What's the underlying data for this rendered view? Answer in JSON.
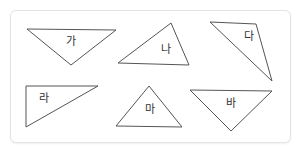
{
  "diagram": {
    "type": "triangle-classification",
    "stroke_color": "#555555",
    "border_color": "#e3e3e3",
    "triangles": [
      {
        "label": "가",
        "points": "27,29 116,30 71,65",
        "label_x": 71,
        "label_y": 42
      },
      {
        "label": "나",
        "points": "118,63 171,23 189,65",
        "label_x": 166,
        "label_y": 50
      },
      {
        "label": "다",
        "points": "210,22 256,24 272,81",
        "label_x": 249,
        "label_y": 37
      },
      {
        "label": "라",
        "points": "26,86 98,86 26,127",
        "label_x": 44,
        "label_y": 99
      },
      {
        "label": "마",
        "points": "116,126 149,86 182,127",
        "label_x": 150,
        "label_y": 110
      },
      {
        "label": "바",
        "points": "190,90 272,91 231,131",
        "label_x": 231,
        "label_y": 104
      }
    ]
  }
}
